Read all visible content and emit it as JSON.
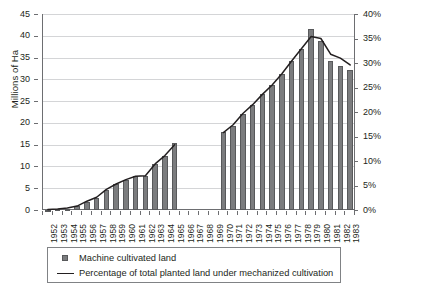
{
  "chart_data": {
    "type": "bar",
    "title": "",
    "subtitle": "",
    "xlabel": "",
    "ylabel": "Millions of Ha",
    "y2label": "",
    "grid": true,
    "legend_position": "bottom",
    "categories": [
      "1952",
      "1953",
      "1954",
      "1955",
      "1956",
      "1957",
      "1958",
      "1959",
      "1960",
      "1961",
      "1962",
      "1963",
      "1964",
      "1965",
      "1966",
      "1967",
      "1968",
      "1969",
      "1970",
      "1971",
      "1972",
      "1973",
      "1974",
      "1975",
      "1976",
      "1977",
      "1978",
      "1979",
      "1980",
      "1981",
      "1982",
      "1983"
    ],
    "ylim": [
      0,
      45
    ],
    "yticks": [
      0,
      5,
      10,
      15,
      20,
      25,
      30,
      35,
      40,
      45
    ],
    "ytick_labels": [
      "0",
      "5",
      "10",
      "15",
      "20",
      "25",
      "30",
      "35",
      "40",
      "45"
    ],
    "y2lim": [
      0,
      40
    ],
    "y2ticks": [
      0,
      5,
      10,
      15,
      20,
      25,
      30,
      35,
      40
    ],
    "y2tick_labels": [
      "0%",
      "5%",
      "10%",
      "15%",
      "20%",
      "25%",
      "30%",
      "35%",
      "40%"
    ],
    "series": [
      {
        "name": "Machine cultivated land",
        "type": "bar",
        "axis": "left",
        "unit": "Millions of Ha",
        "color": "#7b7c7e",
        "values": [
          0.1,
          0.15,
          0.3,
          0.9,
          1.9,
          2.7,
          4.6,
          5.9,
          6.9,
          7.7,
          7.9,
          10.6,
          12.3,
          15.3,
          null,
          null,
          null,
          null,
          17.8,
          19.4,
          22.1,
          24.2,
          26.6,
          28.6,
          31.2,
          34.2,
          37.0,
          41.5,
          38.8,
          34.3,
          33.0,
          32.2
        ]
      },
      {
        "name": "Percentage of total planted land under mechanized cultivation",
        "type": "line",
        "axis": "right",
        "unit": "%",
        "color": "#231f20",
        "values": [
          0.1,
          0.2,
          0.4,
          0.8,
          1.8,
          2.6,
          4.2,
          5.3,
          6.2,
          6.9,
          7.0,
          9.4,
          11.1,
          13.3,
          null,
          null,
          null,
          null,
          15.8,
          17.4,
          19.7,
          21.5,
          23.6,
          25.5,
          27.8,
          30.4,
          32.9,
          35.4,
          35.0,
          31.8,
          31.0,
          29.6
        ]
      }
    ],
    "legend": [
      {
        "label": "Machine cultivated land",
        "marker": "square"
      },
      {
        "label": "Percentage of total planted land under mechanized cultivation",
        "marker": "line"
      }
    ],
    "note": "Data gap for years 1966-1969 (no bars or line segment plotted)"
  }
}
